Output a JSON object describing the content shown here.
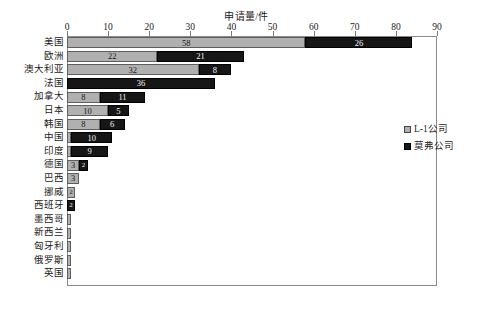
{
  "chart_data": {
    "type": "bar",
    "orientation": "horizontal",
    "stacked": true,
    "title": "",
    "xlabel": "申请量/件",
    "ylabel": "",
    "xlim": [
      0,
      90
    ],
    "xticks": [
      0,
      10,
      20,
      30,
      40,
      50,
      60,
      70,
      80,
      90
    ],
    "grid": false,
    "legend_position": "right",
    "categories": [
      "美国",
      "欧洲",
      "澳大利亚",
      "法国",
      "加拿大",
      "日本",
      "韩国",
      "中国",
      "印度",
      "德国",
      "巴西",
      "挪威",
      "西班牙",
      "墨西哥",
      "新西兰",
      "匈牙利",
      "俄罗斯",
      "英国"
    ],
    "series": [
      {
        "name": "L-1公司",
        "color": "#b0b0b0",
        "values": [
          58,
          22,
          32,
          0,
          8,
          10,
          8,
          1,
          1,
          3,
          3,
          2,
          0,
          1,
          1,
          1,
          1,
          1
        ]
      },
      {
        "name": "莫弗公司",
        "color": "#161616",
        "values": [
          26,
          21,
          8,
          36,
          11,
          5,
          6,
          10,
          9,
          2,
          0,
          0,
          2,
          0,
          0,
          0,
          0,
          0
        ]
      }
    ],
    "bar_labels": [
      [
        {
          "series": "L-1公司",
          "value": 58,
          "text": "58"
        },
        {
          "series": "莫弗公司",
          "value": 26,
          "text": "26"
        }
      ],
      [
        {
          "series": "L-1公司",
          "value": 22,
          "text": "22"
        },
        {
          "series": "莫弗公司",
          "value": 21,
          "text": "21"
        }
      ],
      [
        {
          "series": "L-1公司",
          "value": 32,
          "text": "32"
        },
        {
          "series": "莫弗公司",
          "value": 8,
          "text": "8"
        }
      ],
      [
        {
          "series": "莫弗公司",
          "value": 36,
          "text": "36"
        }
      ],
      [
        {
          "series": "L-1公司",
          "value": 8,
          "text": "8"
        },
        {
          "series": "莫弗公司",
          "value": 11,
          "text": "11"
        }
      ],
      [
        {
          "series": "L-1公司",
          "value": 10,
          "text": "10"
        },
        {
          "series": "莫弗公司",
          "value": 5,
          "text": "5"
        }
      ],
      [
        {
          "series": "L-1公司",
          "value": 8,
          "text": "8"
        },
        {
          "series": "莫弗公司",
          "value": 6,
          "text": "6"
        }
      ],
      [
        {
          "series": "莫弗公司",
          "value": 10,
          "text": "10"
        }
      ],
      [
        {
          "series": "莫弗公司",
          "value": 9,
          "text": "9"
        }
      ],
      [
        {
          "series": "L-1公司",
          "value": 3,
          "text": "3"
        },
        {
          "series": "莫弗公司",
          "value": 2,
          "text": "2"
        }
      ],
      [
        {
          "series": "L-1公司",
          "value": 3,
          "text": "3"
        }
      ],
      [
        {
          "series": "L-1公司",
          "value": 2,
          "text": "2"
        }
      ],
      [
        {
          "series": "莫弗公司",
          "value": 2,
          "text": "2"
        }
      ],
      [
        {
          "series": "L-1公司",
          "value": 1,
          "text": "1"
        }
      ],
      [
        {
          "series": "L-1公司",
          "value": 1,
          "text": "1"
        }
      ],
      [
        {
          "series": "L-1公司",
          "value": 1,
          "text": "1"
        }
      ],
      [
        {
          "series": "L-1公司",
          "value": 1,
          "text": "1"
        }
      ],
      [
        {
          "series": "L-1公司",
          "value": 1,
          "text": "1"
        }
      ]
    ]
  },
  "axis": {
    "title": "申请量/件",
    "tick_labels": [
      "0",
      "10",
      "20",
      "30",
      "40",
      "50",
      "60",
      "70",
      "80",
      "90"
    ]
  },
  "legend": {
    "items": [
      {
        "label": "L-1公司",
        "swatch": "gray-swatch-icon"
      },
      {
        "label": "莫弗公司",
        "swatch": "black-swatch-icon"
      }
    ]
  },
  "caption": {
    "text": ""
  }
}
